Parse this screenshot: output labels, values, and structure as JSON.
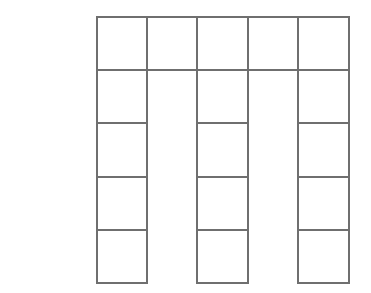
{
  "figure": {
    "panel_label": "(e)",
    "caption_text": "(e)",
    "background_color": "#fdfdfd",
    "line_color": "#6f6f6f",
    "cell_fill_color": "#ffffff",
    "label_color": "#2b2b2b"
  },
  "diagram": {
    "type": "grid-comb-polyomino",
    "columns_count": 5,
    "rows_count": 5,
    "cell_width": 50.4,
    "cell_height": 53.2,
    "origin_x": 96.6,
    "origin_y": 17.0,
    "full_height_columns": [
      1,
      3,
      5
    ],
    "short_columns": [
      2,
      4
    ],
    "short_column_filled_rows": 1,
    "total_cells": 17,
    "column_x_positions": [
      96.6,
      147.0,
      197.4,
      247.8,
      298.2,
      348.6
    ],
    "row_y_positions": [
      17.0,
      70.2,
      123.4,
      176.6,
      229.8,
      283.0
    ],
    "cells": [
      {
        "row": 1,
        "col": 1,
        "present": true
      },
      {
        "row": 1,
        "col": 2,
        "present": true
      },
      {
        "row": 1,
        "col": 3,
        "present": true
      },
      {
        "row": 1,
        "col": 4,
        "present": true
      },
      {
        "row": 1,
        "col": 5,
        "present": true
      },
      {
        "row": 2,
        "col": 1,
        "present": true
      },
      {
        "row": 2,
        "col": 2,
        "present": false
      },
      {
        "row": 2,
        "col": 3,
        "present": true
      },
      {
        "row": 2,
        "col": 4,
        "present": false
      },
      {
        "row": 2,
        "col": 5,
        "present": true
      },
      {
        "row": 3,
        "col": 1,
        "present": true
      },
      {
        "row": 3,
        "col": 2,
        "present": false
      },
      {
        "row": 3,
        "col": 3,
        "present": true
      },
      {
        "row": 3,
        "col": 4,
        "present": false
      },
      {
        "row": 3,
        "col": 5,
        "present": true
      },
      {
        "row": 4,
        "col": 1,
        "present": true
      },
      {
        "row": 4,
        "col": 2,
        "present": false
      },
      {
        "row": 4,
        "col": 3,
        "present": true
      },
      {
        "row": 4,
        "col": 4,
        "present": false
      },
      {
        "row": 4,
        "col": 5,
        "present": true
      },
      {
        "row": 5,
        "col": 1,
        "present": true
      },
      {
        "row": 5,
        "col": 2,
        "present": false
      },
      {
        "row": 5,
        "col": 3,
        "present": true
      },
      {
        "row": 5,
        "col": 4,
        "present": false
      },
      {
        "row": 5,
        "col": 5,
        "present": true
      }
    ],
    "vertical_segments": [
      {
        "x": 96.6,
        "y1": 17.0,
        "y2": 283.0
      },
      {
        "x": 147.0,
        "y1": 17.0,
        "y2": 283.0
      },
      {
        "x": 197.4,
        "y1": 17.0,
        "y2": 283.0
      },
      {
        "x": 247.8,
        "y1": 17.0,
        "y2": 283.0
      },
      {
        "x": 298.2,
        "y1": 17.0,
        "y2": 283.0
      },
      {
        "x": 348.6,
        "y1": 17.0,
        "y2": 283.0
      }
    ],
    "horizontal_segments": [
      {
        "y": 17.0,
        "x1": 96.6,
        "x2": 348.6
      },
      {
        "y": 70.2,
        "x1": 96.6,
        "x2": 348.6
      },
      {
        "y": 123.4,
        "x1": 96.6,
        "x2": 147.0
      },
      {
        "y": 123.4,
        "x1": 197.4,
        "x2": 247.8
      },
      {
        "y": 123.4,
        "x1": 298.2,
        "x2": 348.6
      },
      {
        "y": 176.6,
        "x1": 96.6,
        "x2": 147.0
      },
      {
        "y": 176.6,
        "x1": 197.4,
        "x2": 247.8
      },
      {
        "y": 176.6,
        "x1": 298.2,
        "x2": 348.6
      },
      {
        "y": 229.8,
        "x1": 96.6,
        "x2": 147.0
      },
      {
        "y": 229.8,
        "x1": 197.4,
        "x2": 247.8
      },
      {
        "y": 229.8,
        "x1": 298.2,
        "x2": 348.6
      },
      {
        "y": 283.0,
        "x1": 96.6,
        "x2": 147.0
      },
      {
        "y": 283.0,
        "x1": 197.4,
        "x2": 247.8
      },
      {
        "y": 283.0,
        "x1": 298.2,
        "x2": 348.6
      }
    ]
  }
}
